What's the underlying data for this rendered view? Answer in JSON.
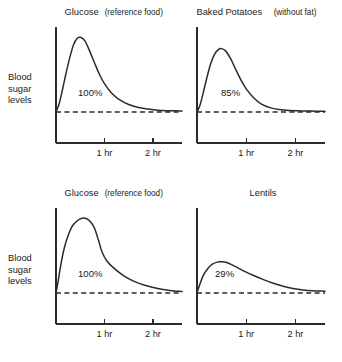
{
  "figure": {
    "name": "glycemic-response-curves",
    "background_color": "#ffffff",
    "ink_color": "#2b2b2b",
    "y_axis_label_lines": [
      "Blood",
      "sugar",
      "levels"
    ],
    "tick_labels": [
      "1 hr",
      "2 hr"
    ]
  },
  "chart_data": [
    {
      "type": "line",
      "id": "glucose-top",
      "title": "Glucose (reference food)",
      "title_main": "Glucose",
      "title_sub": "(reference food)",
      "value_label": "100%",
      "xlabel": "",
      "ylabel": "Blood sugar levels",
      "xlim": [
        0,
        2.6
      ],
      "ylim": [
        0,
        1.1
      ],
      "xticks": [
        1,
        2
      ],
      "xticklabels": [
        "1 hr",
        "2 hr"
      ],
      "grid": false,
      "legend": "none",
      "baseline": 0,
      "baseline_style": "dashed",
      "peak_x": 0.52,
      "peak_y": 1.0,
      "x": [
        0.0,
        0.06,
        0.12,
        0.2,
        0.28,
        0.36,
        0.44,
        0.52,
        0.6,
        0.7,
        0.8,
        0.9,
        1.0,
        1.15,
        1.3,
        1.5,
        1.7,
        1.9,
        2.1,
        2.3,
        2.6
      ],
      "y": [
        0.0,
        0.1,
        0.26,
        0.5,
        0.72,
        0.9,
        0.99,
        1.0,
        0.95,
        0.81,
        0.65,
        0.5,
        0.38,
        0.25,
        0.17,
        0.1,
        0.06,
        0.04,
        0.025,
        0.018,
        0.012
      ]
    },
    {
      "type": "line",
      "id": "baked-potatoes",
      "title": "Baked Potatoes (without fat)",
      "title_main": "Baked Potatoes",
      "title_sub": "(without fat)",
      "value_label": "85%",
      "xlabel": "",
      "ylabel": "",
      "xlim": [
        0,
        2.6
      ],
      "ylim": [
        0,
        1.1
      ],
      "xticks": [
        1,
        2
      ],
      "xticklabels": [
        "1 hr",
        "2 hr"
      ],
      "grid": false,
      "legend": "none",
      "baseline": 0,
      "baseline_style": "dashed",
      "peak_x": 0.5,
      "peak_y": 0.85,
      "x": [
        0.0,
        0.06,
        0.12,
        0.2,
        0.28,
        0.36,
        0.44,
        0.5,
        0.58,
        0.68,
        0.78,
        0.9,
        1.0,
        1.15,
        1.3,
        1.5,
        1.7,
        1.9,
        2.1,
        2.3,
        2.6
      ],
      "y": [
        0.0,
        0.09,
        0.24,
        0.46,
        0.65,
        0.78,
        0.84,
        0.85,
        0.82,
        0.72,
        0.58,
        0.42,
        0.31,
        0.19,
        0.11,
        0.055,
        0.03,
        0.02,
        0.015,
        0.012,
        0.01
      ]
    },
    {
      "type": "line",
      "id": "glucose-bottom",
      "title": "Glucose (reference food)",
      "title_main": "Glucose",
      "title_sub": "(reference food)",
      "value_label": "100%",
      "xlabel": "",
      "ylabel": "Blood sugar levels",
      "xlim": [
        0,
        2.6
      ],
      "ylim": [
        0,
        1.1
      ],
      "xticks": [
        1,
        2
      ],
      "xticklabels": [
        "1 hr",
        "2 hr"
      ],
      "grid": false,
      "legend": "none",
      "baseline": 0,
      "baseline_style": "dashed",
      "peak_x": 0.62,
      "peak_y": 1.0,
      "x": [
        0.0,
        0.05,
        0.1,
        0.17,
        0.25,
        0.33,
        0.42,
        0.52,
        0.62,
        0.72,
        0.8,
        0.88,
        0.95,
        1.05,
        1.2,
        1.4,
        1.6,
        1.85,
        2.1,
        2.35,
        2.6
      ],
      "y": [
        0.0,
        0.18,
        0.38,
        0.6,
        0.77,
        0.89,
        0.96,
        1.0,
        1.0,
        0.95,
        0.86,
        0.7,
        0.55,
        0.43,
        0.33,
        0.23,
        0.16,
        0.1,
        0.06,
        0.035,
        0.02
      ]
    },
    {
      "type": "line",
      "id": "lentils",
      "title": "Lentils",
      "title_main": "Lentils",
      "title_sub": "",
      "value_label": "29%",
      "xlabel": "",
      "ylabel": "",
      "xlim": [
        0,
        2.6
      ],
      "ylim": [
        0,
        1.1
      ],
      "xticks": [
        1,
        2
      ],
      "xticklabels": [
        "1 hr",
        "2 hr"
      ],
      "grid": false,
      "legend": "none",
      "baseline": 0,
      "baseline_style": "dashed",
      "peak_x": 0.5,
      "peak_y": 0.42,
      "x": [
        0.0,
        0.06,
        0.13,
        0.22,
        0.32,
        0.42,
        0.5,
        0.6,
        0.72,
        0.85,
        1.0,
        1.15,
        1.35,
        1.55,
        1.75,
        1.95,
        2.15,
        2.35,
        2.6
      ],
      "y": [
        0.0,
        0.12,
        0.24,
        0.33,
        0.39,
        0.415,
        0.42,
        0.41,
        0.375,
        0.33,
        0.28,
        0.235,
        0.18,
        0.13,
        0.09,
        0.06,
        0.04,
        0.03,
        0.025
      ]
    }
  ],
  "panels": [
    {
      "name": "panel-glucose-top",
      "chart_index": 0,
      "plot_x": 56,
      "plot_y": 30,
      "plot_w": 126,
      "plot_h": 113,
      "baseline_y": 112,
      "title_x": 119,
      "title_y": 15,
      "pct_x": 78,
      "pct_y": 96,
      "show_y_label": true,
      "y_label_x": 8,
      "y_label_y": 80
    },
    {
      "name": "panel-baked-potatoes",
      "chart_index": 1,
      "plot_x": 197,
      "plot_y": 30,
      "plot_w": 128,
      "plot_h": 113,
      "baseline_y": 112,
      "title_x": 263,
      "title_y": 15,
      "pct_x": 221,
      "pct_y": 96,
      "show_y_label": false,
      "y_label_x": 0,
      "y_label_y": 0
    },
    {
      "name": "panel-glucose-bottom",
      "chart_index": 2,
      "plot_x": 56,
      "plot_y": 211,
      "plot_w": 126,
      "plot_h": 113,
      "baseline_y": 293,
      "title_x": 119,
      "title_y": 196,
      "pct_x": 78,
      "pct_y": 277,
      "show_y_label": true,
      "y_label_x": 8,
      "y_label_y": 261
    },
    {
      "name": "panel-lentils",
      "chart_index": 3,
      "plot_x": 197,
      "plot_y": 211,
      "plot_w": 128,
      "plot_h": 113,
      "baseline_y": 293,
      "title_x": 263,
      "title_y": 196,
      "pct_x": 215,
      "pct_y": 277,
      "show_y_label": false,
      "y_label_x": 0,
      "y_label_y": 0
    }
  ]
}
